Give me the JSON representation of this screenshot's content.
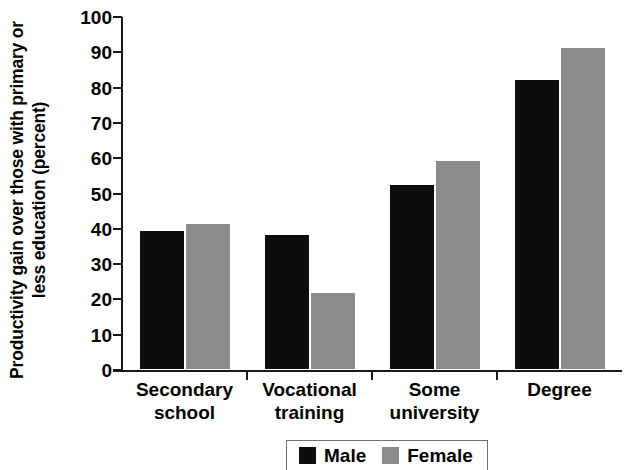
{
  "chart_data": {
    "type": "bar",
    "title": "",
    "xlabel": "",
    "ylabel": "Productivity gain over those with primary or less education (percent)",
    "ylabel_line1": "Productivity gain over those with primary or",
    "ylabel_line2": "less education (percent)",
    "categories": [
      "Secondary school",
      "Vocational training",
      "Some university",
      "Degree"
    ],
    "category_lines": [
      [
        "Secondary",
        "school"
      ],
      [
        "Vocational",
        "training"
      ],
      [
        "Some",
        "university"
      ],
      [
        "Degree",
        ""
      ]
    ],
    "series": [
      {
        "name": "Male",
        "color": "#0d0d0d",
        "values": [
          39,
          38,
          52,
          82
        ]
      },
      {
        "name": "Female",
        "color": "#8c8c8c",
        "values": [
          41,
          21.5,
          59,
          91
        ]
      }
    ],
    "ylim": [
      0,
      100
    ],
    "ytick_values": [
      0,
      10,
      20,
      30,
      40,
      50,
      60,
      70,
      80,
      90,
      100
    ],
    "ytick_labels": [
      "0",
      "10",
      "20",
      "30",
      "40",
      "50",
      "60",
      "70",
      "80",
      "90",
      "100"
    ],
    "grid": false,
    "legend_position": "bottom-right"
  },
  "legend": {
    "items": [
      {
        "label": "Male",
        "color": "#0d0d0d"
      },
      {
        "label": "Female",
        "color": "#8c8c8c"
      }
    ]
  }
}
